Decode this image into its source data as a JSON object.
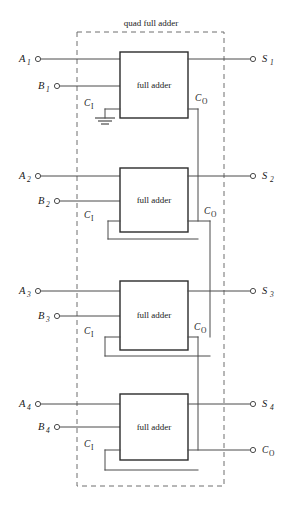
{
  "diagram": {
    "title": "quad full adder",
    "block_label": "full adder",
    "stages": [
      {
        "a_label": "A",
        "a_sub": "1",
        "b_label": "B",
        "b_sub": "1",
        "s_label": "S",
        "s_sub": "1",
        "ci_label": "C",
        "ci_sub": "I",
        "co_label": "C",
        "co_sub": "O",
        "carry_in_source": "ground",
        "block": "full adder"
      },
      {
        "a_label": "A",
        "a_sub": "2",
        "b_label": "B",
        "b_sub": "2",
        "s_label": "S",
        "s_sub": "2",
        "ci_label": "C",
        "ci_sub": "I",
        "co_label": "C",
        "co_sub": "O",
        "carry_in_source": "stage-1-carry-out",
        "block": "full adder"
      },
      {
        "a_label": "A",
        "a_sub": "3",
        "b_label": "B",
        "b_sub": "3",
        "s_label": "S",
        "s_sub": "3",
        "ci_label": "C",
        "ci_sub": "I",
        "co_label": "C",
        "co_sub": "O",
        "carry_in_source": "stage-2-carry-out",
        "block": "full adder"
      },
      {
        "a_label": "A",
        "a_sub": "4",
        "b_label": "B",
        "b_sub": "4",
        "s_label": "S",
        "s_sub": "4",
        "ci_label": "C",
        "ci_sub": "I",
        "co_label": "C",
        "co_sub": "O",
        "carry_in_source": "stage-3-carry-out",
        "block": "full adder"
      }
    ],
    "final_carry_out": {
      "label": "C",
      "sub": "O"
    },
    "colors": {
      "wire": "#4a4a4a",
      "box_stroke": "#2b2b2b",
      "boundary": "#6e6e6e",
      "background": "#ffffff",
      "text": "#1a1a1a"
    }
  }
}
